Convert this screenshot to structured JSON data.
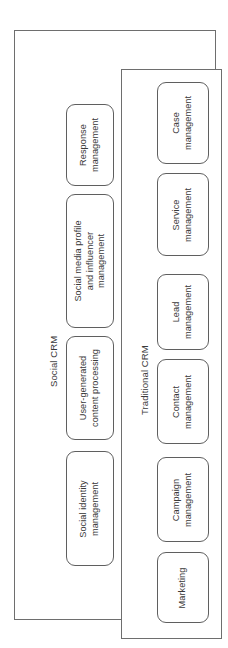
{
  "diagram": {
    "orientation": "rotated-90-ccw",
    "groups": [
      {
        "id": "social-crm",
        "label": "Social CRM",
        "nodes": [
          {
            "id": "response-management",
            "label": "Response\nmanagement"
          },
          {
            "id": "social-media-profile-and-influencer-management",
            "label": "Social media profile\nand influencer\nmanagement"
          },
          {
            "id": "user-generated-content-processing",
            "label": "User-generated\ncontent processing"
          },
          {
            "id": "social-identity-management",
            "label": "Social identity\nmanagement"
          }
        ]
      },
      {
        "id": "traditional-crm",
        "label": "Traditional CRM",
        "nodes": [
          {
            "id": "case-management",
            "label": "Case\nmanagement"
          },
          {
            "id": "service-management",
            "label": "Service\nmanagement"
          },
          {
            "id": "lead-management",
            "label": "Lead\nmanagement"
          },
          {
            "id": "contact-management",
            "label": "Contact\nmanagement"
          },
          {
            "id": "campaign-management",
            "label": "Campaign\nmanagement"
          },
          {
            "id": "marketing",
            "label": "Marketing"
          }
        ]
      }
    ],
    "colors": {
      "border": "#6e6e6e",
      "node_border": "#5f5f5f",
      "text": "#3a3a3a",
      "background": "#ffffff"
    }
  }
}
